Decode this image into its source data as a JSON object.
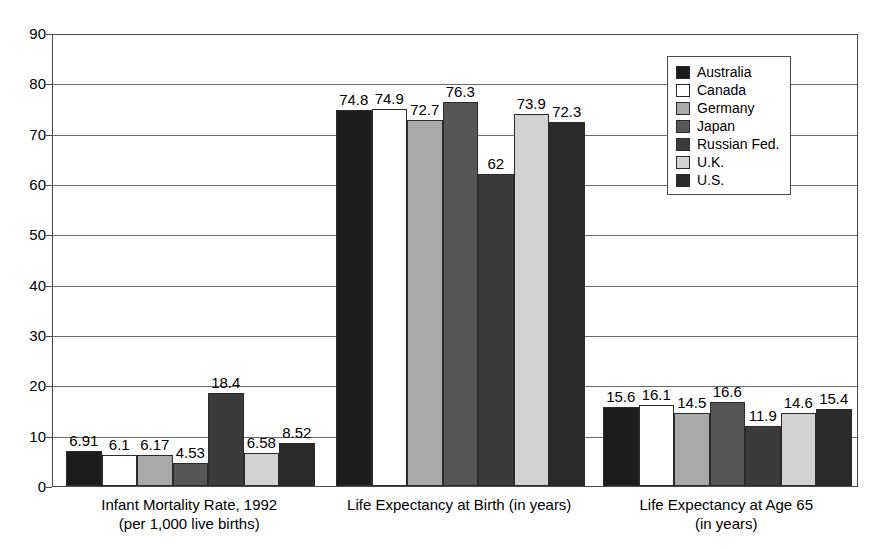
{
  "chart_data": {
    "type": "bar",
    "title": "",
    "xlabel": "",
    "ylabel": "",
    "ylim": [
      0,
      90
    ],
    "ytick_step": 10,
    "yticks": [
      90,
      80,
      70,
      60,
      50,
      40,
      30,
      20,
      10,
      0
    ],
    "grid": true,
    "legend_position": "top-right-inside",
    "categories": [
      "Infant Mortality Rate, 1992\n(per 1,000 live births)",
      "Life Expectancy at Birth (in years)",
      "Life Expectancy at Age 65\n(in years)"
    ],
    "category_lines": [
      [
        "Infant Mortality Rate, 1992",
        "(per 1,000 live births)"
      ],
      [
        "Life Expectancy at Birth (in years)"
      ],
      [
        "Life Expectancy at Age 65",
        "(in years)"
      ]
    ],
    "series": [
      {
        "name": "Australia",
        "color": "#1c1c1c",
        "values": [
          6.91,
          74.8,
          15.6
        ]
      },
      {
        "name": "Canada",
        "color": "#ffffff",
        "values": [
          6.1,
          74.9,
          16.1
        ]
      },
      {
        "name": "Germany",
        "color": "#a9a9a9",
        "values": [
          6.17,
          72.7,
          14.5
        ]
      },
      {
        "name": "Japan",
        "color": "#565656",
        "values": [
          4.53,
          76.3,
          16.6
        ]
      },
      {
        "name": "Russian Fed.",
        "color": "#3b3b3b",
        "values": [
          18.4,
          62,
          11.9
        ]
      },
      {
        "name": "U.K.",
        "color": "#d2d2d2",
        "values": [
          6.58,
          73.9,
          14.6
        ]
      },
      {
        "name": "U.S.",
        "color": "#2a2a2a",
        "values": [
          8.52,
          72.3,
          15.4
        ]
      }
    ],
    "value_labels": [
      [
        "6.91",
        "6.1",
        "6.17",
        "4.53",
        "18.4",
        "6.58",
        "8.52"
      ],
      [
        "74.8",
        "74.9",
        "72.7",
        "76.3",
        "62",
        "73.9",
        "72.3"
      ],
      [
        "15.6",
        "16.1",
        "14.5",
        "16.6",
        "11.9",
        "14.6",
        "15.4"
      ]
    ]
  },
  "legend": {
    "items": [
      {
        "label": "Australia"
      },
      {
        "label": "Canada"
      },
      {
        "label": "Germany"
      },
      {
        "label": "Japan"
      },
      {
        "label": "Russian Fed."
      },
      {
        "label": "U.K."
      },
      {
        "label": "U.S."
      }
    ]
  }
}
